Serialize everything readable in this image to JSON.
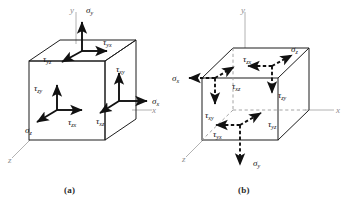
{
  "figure": {
    "type": "stress-element-diagram",
    "background_color": "#ffffff",
    "stroke_color": "#1a1a1a",
    "axis_color": "#a8a8a8"
  },
  "captions": {
    "a": "(a)",
    "b": "(b)"
  },
  "panel_a": {
    "caption": "(a)",
    "axes": [
      {
        "name": "y-axis-label",
        "label": "y"
      },
      {
        "name": "x-axis-label",
        "label": "x"
      },
      {
        "name": "z-axis-label",
        "label": "z"
      }
    ],
    "stresses": [
      {
        "name": "sigma-y",
        "symbol": "σ",
        "sub": "y",
        "face": "top",
        "direction": "up"
      },
      {
        "name": "tau-yx",
        "symbol": "τ",
        "sub": "yx",
        "face": "top",
        "direction": "right"
      },
      {
        "name": "tau-yz",
        "symbol": "τ",
        "sub": "yz",
        "face": "top",
        "direction": "down-left"
      },
      {
        "name": "sigma-z",
        "symbol": "σ",
        "sub": "z",
        "face": "front",
        "direction": "down-left"
      },
      {
        "name": "tau-zy",
        "symbol": "τ",
        "sub": "zy",
        "face": "front",
        "direction": "up"
      },
      {
        "name": "tau-zx",
        "symbol": "τ",
        "sub": "zx",
        "face": "front",
        "direction": "right"
      },
      {
        "name": "sigma-x",
        "symbol": "σ",
        "sub": "x",
        "face": "right",
        "direction": "right"
      },
      {
        "name": "tau-xy",
        "symbol": "τ",
        "sub": "xy",
        "face": "right",
        "direction": "up"
      },
      {
        "name": "tau-xz",
        "symbol": "τ",
        "sub": "xz",
        "face": "right",
        "direction": "down-left"
      }
    ]
  },
  "panel_b": {
    "caption": "(b)",
    "axes": [
      {
        "name": "y-axis-label",
        "label": "y"
      },
      {
        "name": "x-axis-label",
        "label": "x"
      },
      {
        "name": "z-axis-label",
        "label": "z"
      }
    ],
    "stresses": [
      {
        "name": "sigma-y",
        "symbol": "σ",
        "sub": "y",
        "face": "bottom",
        "direction": "down"
      },
      {
        "name": "tau-yx",
        "symbol": "τ",
        "sub": "yx",
        "face": "bottom",
        "direction": "left"
      },
      {
        "name": "tau-yz",
        "symbol": "τ",
        "sub": "yz",
        "face": "bottom",
        "direction": "up-right"
      },
      {
        "name": "sigma-z",
        "symbol": "σ",
        "sub": "z",
        "face": "back",
        "direction": "up-right"
      },
      {
        "name": "tau-zy",
        "symbol": "τ",
        "sub": "zy",
        "face": "back",
        "direction": "down"
      },
      {
        "name": "tau-zx",
        "symbol": "τ",
        "sub": "zx",
        "face": "back",
        "direction": "left"
      },
      {
        "name": "sigma-x",
        "symbol": "σ",
        "sub": "x",
        "face": "left",
        "direction": "left"
      },
      {
        "name": "tau-xy",
        "symbol": "τ",
        "sub": "xy",
        "face": "left",
        "direction": "down"
      },
      {
        "name": "tau-xz",
        "symbol": "τ",
        "sub": "xz",
        "face": "left",
        "direction": "up-right"
      }
    ]
  }
}
